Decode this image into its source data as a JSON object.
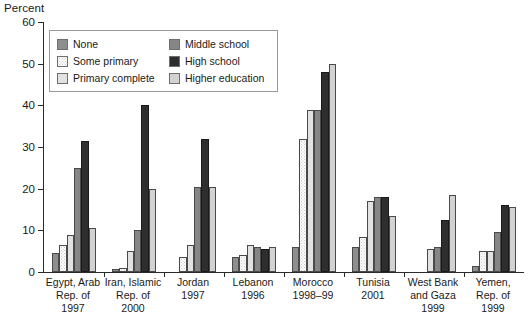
{
  "chart_data": {
    "type": "bar",
    "title": "",
    "ylabel": "Percent",
    "xlabel": "",
    "ylim": [
      0,
      60
    ],
    "yticks": [
      0,
      10,
      20,
      30,
      40,
      50,
      60
    ],
    "grid": false,
    "legend_position": "inside-top-left",
    "categories": [
      "Egypt, Arab Rep. of 1997",
      "Iran, Islamic Rep. of 2000",
      "Jordan 1997",
      "Lebanon 1996",
      "Morocco 1998–99",
      "Tunisia 2001",
      "West Bank and Gaza 1999",
      "Yemen, Rep. of 1999"
    ],
    "series": [
      {
        "name": "None",
        "values": [
          4.5,
          0.7,
          0.0,
          3.5,
          6.0,
          6.0,
          0.0,
          1.5
        ]
      },
      {
        "name": "Some primary",
        "values": [
          6.5,
          1.0,
          3.5,
          4.0,
          32.0,
          8.5,
          0.0,
          5.0
        ]
      },
      {
        "name": "Primary complete",
        "values": [
          9.0,
          5.0,
          6.5,
          6.5,
          39.0,
          17.0,
          5.5,
          5.0
        ]
      },
      {
        "name": "Middle school",
        "values": [
          25.0,
          10.0,
          20.5,
          6.0,
          39.0,
          18.0,
          6.0,
          9.5
        ]
      },
      {
        "name": "High school",
        "values": [
          31.5,
          40.0,
          32.0,
          5.5,
          48.0,
          18.0,
          12.5,
          16.0
        ]
      },
      {
        "name": "Higher education",
        "values": [
          10.5,
          20.0,
          20.5,
          6.0,
          50.0,
          13.5,
          18.5,
          15.5
        ]
      }
    ]
  },
  "axis": {
    "ylabel": "Percent",
    "ytick_labels": [
      "0",
      "10",
      "20",
      "30",
      "40",
      "50",
      "60"
    ]
  },
  "legend": {
    "items": [
      {
        "label": "None",
        "color": "#8e8e8e"
      },
      {
        "label": "Some primary",
        "color": "#fdfdfd"
      },
      {
        "label": "Primary complete",
        "color": "#e2e2e2"
      },
      {
        "label": "Middle school",
        "color": "#868686"
      },
      {
        "label": "High school",
        "color": "#2e2e2e"
      },
      {
        "label": "Higher education",
        "color": "#d2d2d2"
      }
    ]
  },
  "xaxis": {
    "groups": [
      {
        "lines": [
          "Egypt, Arab",
          "Rep. of",
          "1997"
        ]
      },
      {
        "lines": [
          "Iran, Islamic",
          "Rep. of",
          "2000"
        ]
      },
      {
        "lines": [
          "Jordan",
          "1997"
        ]
      },
      {
        "lines": [
          "Lebanon",
          "1996"
        ]
      },
      {
        "lines": [
          "Morocco",
          "1998–99"
        ]
      },
      {
        "lines": [
          "Tunisia",
          "2001"
        ]
      },
      {
        "lines": [
          "West Bank",
          "and Gaza",
          "1999"
        ]
      },
      {
        "lines": [
          "Yemen,",
          "Rep. of",
          "1999"
        ]
      }
    ]
  }
}
